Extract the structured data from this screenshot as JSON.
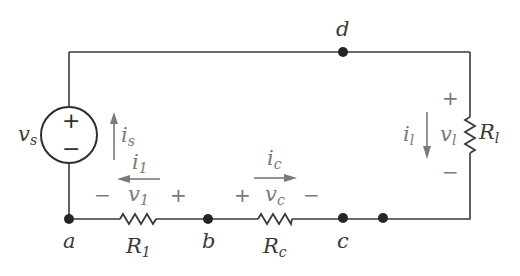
{
  "diagram": {
    "type": "electrical-circuit",
    "nodes": [
      {
        "id": "a",
        "label": "a"
      },
      {
        "id": "b",
        "label": "b"
      },
      {
        "id": "c",
        "label": "c"
      },
      {
        "id": "d",
        "label": "d"
      }
    ],
    "source": {
      "name": "v",
      "sub": "s",
      "plus": "+",
      "minus": "−",
      "current": {
        "name": "i",
        "sub": "s",
        "direction": "up"
      }
    },
    "resistors": [
      {
        "id": "R1",
        "name": "R",
        "sub": "1",
        "between": [
          "a",
          "b"
        ],
        "voltage": {
          "name": "v",
          "sub": "1",
          "left_sign": "−",
          "right_sign": "+"
        },
        "current": {
          "name": "i",
          "sub": "1",
          "direction": "left"
        }
      },
      {
        "id": "Rc",
        "name": "R",
        "sub": "c",
        "between": [
          "b",
          "c"
        ],
        "voltage": {
          "name": "v",
          "sub": "c",
          "left_sign": "+",
          "right_sign": "−"
        },
        "current": {
          "name": "i",
          "sub": "c",
          "direction": "right"
        }
      },
      {
        "id": "Rl",
        "name": "R",
        "sub": "l",
        "orientation": "vertical",
        "voltage": {
          "name": "v",
          "sub": "l",
          "top_sign": "+",
          "bottom_sign": "−"
        },
        "current": {
          "name": "i",
          "sub": "l",
          "direction": "down"
        }
      }
    ]
  }
}
